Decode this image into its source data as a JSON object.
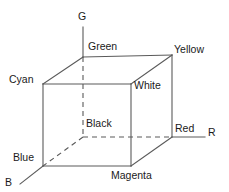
{
  "figure": {
    "type": "diagram",
    "background_color": "#ffffff",
    "line_color": "#5a5a5a",
    "text_color": "#1a1a1a"
  },
  "axes": [
    {
      "id": "g",
      "label": "G",
      "name": "green-axis",
      "from": [
        83,
        57
      ],
      "to": [
        83,
        27
      ]
    },
    {
      "id": "r",
      "label": "R",
      "name": "red-axis",
      "from": [
        172,
        137
      ],
      "to": [
        205,
        137
      ]
    },
    {
      "id": "b",
      "label": "B",
      "name": "blue-axis",
      "from": [
        43,
        166
      ],
      "to": [
        20,
        184
      ]
    }
  ],
  "vertices": [
    {
      "id": "green",
      "label": "Green",
      "x": 83,
      "y": 57,
      "face": "back",
      "rgb": "#00ff00"
    },
    {
      "id": "yellow",
      "label": "Yellow",
      "x": 172,
      "y": 55,
      "face": "back",
      "rgb": "#ffff00"
    },
    {
      "id": "cyan",
      "label": "Cyan",
      "x": 43,
      "y": 84,
      "face": "front",
      "rgb": "#00ffff"
    },
    {
      "id": "white",
      "label": "White",
      "x": 131,
      "y": 84,
      "face": "front",
      "rgb": "#ffffff"
    },
    {
      "id": "black",
      "label": "Black",
      "x": 83,
      "y": 137,
      "face": "back",
      "rgb": "#000000"
    },
    {
      "id": "red",
      "label": "Red",
      "x": 172,
      "y": 137,
      "face": "back",
      "rgb": "#ff0000"
    },
    {
      "id": "blue",
      "label": "Blue",
      "x": 43,
      "y": 166,
      "face": "front",
      "rgb": "#0000ff"
    },
    {
      "id": "magenta",
      "label": "Magenta",
      "x": 131,
      "y": 166,
      "face": "front",
      "rgb": "#ff00ff"
    }
  ],
  "edges": {
    "solid": [
      {
        "from": "cyan",
        "to": "white"
      },
      {
        "from": "white",
        "to": "magenta"
      },
      {
        "from": "magenta",
        "to": "blue"
      },
      {
        "from": "blue",
        "to": "cyan"
      },
      {
        "from": "green",
        "to": "yellow"
      },
      {
        "from": "yellow",
        "to": "red"
      },
      {
        "from": "cyan",
        "to": "green"
      },
      {
        "from": "white",
        "to": "yellow"
      },
      {
        "from": "magenta",
        "to": "red"
      }
    ],
    "dashed": [
      {
        "from": "green",
        "to": "black"
      },
      {
        "from": "black",
        "to": "red"
      },
      {
        "from": "black",
        "to": "blue"
      }
    ]
  }
}
